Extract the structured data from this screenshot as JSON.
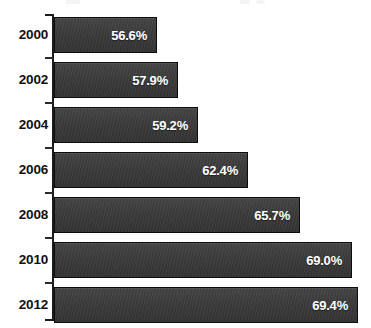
{
  "chart_data": {
    "type": "bar",
    "orientation": "horizontal",
    "title": "",
    "subtitle": "",
    "xlabel": "",
    "ylabel": "",
    "categories": [
      "2000",
      "2002",
      "2004",
      "2006",
      "2008",
      "2010",
      "2012"
    ],
    "values": [
      56.6,
      57.9,
      59.2,
      62.4,
      65.7,
      69.0,
      69.4
    ],
    "value_labels": [
      "56.6%",
      "57.9%",
      "59.2%",
      "62.4%",
      "65.7%",
      "69.0%",
      "69.4%"
    ],
    "value_unit": "%",
    "xlim": [
      50.0,
      71.0
    ],
    "grid": false,
    "legend": false,
    "legend_position": "none",
    "tick_labels": [
      "2000",
      "2002",
      "2004",
      "2006",
      "2008",
      "2010",
      "2012"
    ],
    "series": [
      {
        "name": "",
        "values": [
          56.6,
          57.9,
          59.2,
          62.4,
          65.7,
          69.0,
          69.4
        ]
      }
    ],
    "colors": {
      "bar_fill": "#3c3c3c",
      "bar_border": "#0d0d0d",
      "value_text": "#ffffff",
      "category_text": "#111111",
      "axis": "#1c1c1c",
      "background": "#ffffff"
    }
  },
  "axis": {
    "orientation": "vertical-left",
    "tick_count": 8
  }
}
